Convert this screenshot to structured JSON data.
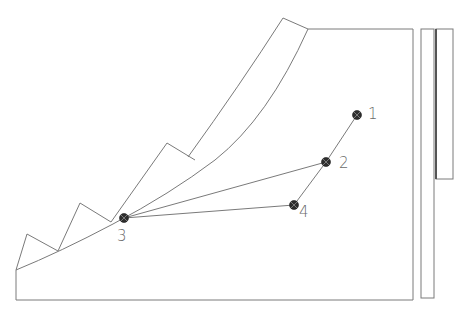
{
  "diagram": {
    "type": "slope-stability-anchor-layout",
    "colors": {
      "line": "#7a7a7a",
      "wall_line": "#555555",
      "anchor_fill": "#2e2e2e",
      "label": "#6a6a6a",
      "background": "#ffffff"
    },
    "points": [
      {
        "id": "1",
        "label": "1",
        "x": 357,
        "y": 115,
        "label_x": 368,
        "label_y": 107
      },
      {
        "id": "2",
        "label": "2",
        "x": 326,
        "y": 162,
        "label_x": 339,
        "label_y": 156
      },
      {
        "id": "3",
        "label": "3",
        "x": 124,
        "y": 218,
        "label_x": 117,
        "label_y": 229
      },
      {
        "id": "4",
        "label": "4",
        "x": 294,
        "y": 205,
        "label_x": 299,
        "label_y": 205
      }
    ],
    "connections": [
      {
        "from": "1",
        "to": "2"
      },
      {
        "from": "2",
        "to": "4"
      },
      {
        "from": "3",
        "to": "2"
      },
      {
        "from": "3",
        "to": "4"
      }
    ],
    "structures": {
      "main_block": "slope body with stepped upper profile",
      "retaining_wall": "narrow vertical rectangle",
      "wall_panel": "upper panel with thick inner edge"
    }
  }
}
